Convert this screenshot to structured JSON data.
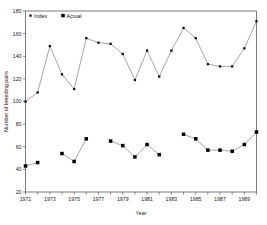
{
  "chart_data": {
    "type": "line",
    "title": "",
    "xlabel": "Year",
    "ylabel": "Number of breeding pairs",
    "xlim": [
      1971,
      1990
    ],
    "ylim": [
      20,
      180
    ],
    "ytick_step": 20,
    "yticks": [
      20,
      40,
      60,
      80,
      100,
      120,
      140,
      160,
      180
    ],
    "ytick_labels": [
      "20",
      "40",
      "60",
      "80",
      "100",
      "120",
      "140",
      "160",
      "180"
    ],
    "xticks": [
      1971,
      1972,
      1973,
      1974,
      1975,
      1976,
      1977,
      1978,
      1979,
      1980,
      1981,
      1982,
      1983,
      1984,
      1985,
      1986,
      1987,
      1988,
      1989,
      1990
    ],
    "xtick_labels": [
      "1971",
      "",
      "1973",
      "",
      "1975",
      "",
      "1977",
      "",
      "1979",
      "",
      "1981",
      "",
      "1983",
      "",
      "1985",
      "",
      "1987",
      "",
      "1989",
      ""
    ],
    "grid": false,
    "legend_position": "top-left",
    "x": [
      1971,
      1972,
      1973,
      1974,
      1975,
      1976,
      1977,
      1978,
      1979,
      1980,
      1981,
      1982,
      1983,
      1984,
      1985,
      1986,
      1987,
      1988,
      1989,
      1990
    ],
    "series": [
      {
        "name": "Index",
        "marker": "small-square",
        "color": "#111111",
        "values": [
          100,
          108,
          149,
          124,
          111,
          156,
          152,
          151,
          142,
          119,
          145,
          122,
          145,
          165,
          156,
          133,
          131,
          131,
          147,
          171
        ]
      },
      {
        "name": "Actual",
        "marker": "large-square",
        "color": "#000000",
        "values": [
          43,
          46,
          null,
          54,
          47,
          67,
          null,
          65,
          61,
          51,
          62,
          53,
          null,
          71,
          67,
          57,
          57,
          56,
          62,
          73
        ]
      }
    ]
  },
  "legend": {
    "items": [
      {
        "label": "Index"
      },
      {
        "label": "Actual"
      }
    ]
  },
  "axes": {
    "x_title": "Year",
    "y_title": "Number of breeding pairs"
  }
}
